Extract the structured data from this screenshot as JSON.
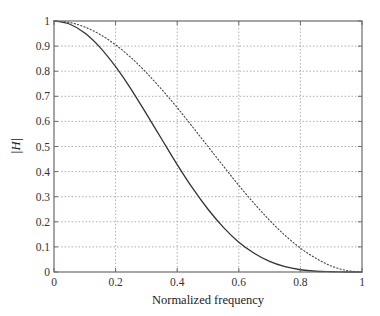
{
  "chart_data": {
    "type": "line",
    "title": "",
    "xlabel": "Normalized frequency",
    "ylabel": "|H|",
    "xlim": [
      0,
      1
    ],
    "ylim": [
      0,
      1
    ],
    "grid": true,
    "grid_style": "dotted",
    "legend": null,
    "xticks": [
      0,
      0.2,
      0.4,
      0.6,
      0.8,
      1
    ],
    "xtick_labels": [
      "0",
      "0.2",
      "0.4",
      "0.6",
      "0.8",
      "1"
    ],
    "yticks": [
      0,
      0.1,
      0.2,
      0.3,
      0.4,
      0.5,
      0.6,
      0.7,
      0.8,
      0.9,
      1
    ],
    "ytick_labels": [
      "0",
      "0.1",
      "0.2",
      "0.3",
      "0.4",
      "0.5",
      "0.6",
      "0.7",
      "0.8",
      "0.9",
      "1"
    ],
    "x": [
      0,
      0.05,
      0.1,
      0.15,
      0.2,
      0.25,
      0.3,
      0.35,
      0.4,
      0.45,
      0.5,
      0.55,
      0.6,
      0.65,
      0.7,
      0.75,
      0.8,
      0.85,
      0.9,
      0.95,
      1.0
    ],
    "series": [
      {
        "name": "solid",
        "line_style": "solid",
        "color": "#333333",
        "values": [
          1.0,
          0.988,
          0.952,
          0.894,
          0.818,
          0.729,
          0.63,
          0.529,
          0.428,
          0.334,
          0.25,
          0.178,
          0.119,
          0.075,
          0.042,
          0.021,
          0.009,
          0.003,
          0.001,
          0.0,
          0.0
        ]
      },
      {
        "name": "dotted",
        "line_style": "dotted",
        "color": "#444444",
        "values": [
          1.0,
          0.994,
          0.976,
          0.946,
          0.905,
          0.854,
          0.794,
          0.727,
          0.655,
          0.578,
          0.5,
          0.422,
          0.345,
          0.273,
          0.206,
          0.146,
          0.095,
          0.055,
          0.024,
          0.006,
          0.0
        ]
      }
    ]
  },
  "colors": {
    "axis": "#6b6b6b",
    "grid": "#9a9a9a",
    "text": "#333333",
    "background": "#ffffff"
  }
}
